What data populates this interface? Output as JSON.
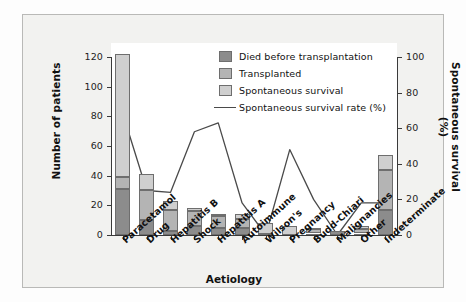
{
  "chart_data": {
    "type": "bar",
    "title": "",
    "subtitle": "",
    "xlabel": "Aetiology",
    "ylabel": "Number of patients",
    "ylabel_secondary": "Spontaneous survival (%)",
    "ylim": [
      0,
      120
    ],
    "ylim_secondary": [
      0,
      100
    ],
    "yticks": [
      0,
      20,
      40,
      60,
      80,
      100,
      120
    ],
    "yticks_secondary": [
      0,
      20,
      40,
      60,
      80,
      100
    ],
    "grid": false,
    "legend_position": "upper-center-right",
    "stacked": true,
    "categories": [
      "Paracetamol",
      "Drug",
      "Hepatitis B",
      "Shock",
      "Hepatitis A",
      "Autoimmune",
      "Wilson's",
      "Pregnancy",
      "Budd-Chiari",
      "Malignancies",
      "Other",
      "Indeterminate"
    ],
    "series": [
      {
        "name": "Died before transplantation",
        "color": "#8c8c8c",
        "values": [
          31,
          10,
          3,
          6,
          5,
          5,
          1,
          0,
          1,
          3,
          1,
          17
        ]
      },
      {
        "name": "Transplanted",
        "color": "#b4b4b4",
        "values": [
          8,
          20,
          14,
          10,
          8,
          6,
          0,
          0,
          3,
          0,
          3,
          27
        ]
      },
      {
        "name": "Spontaneous survival",
        "color": "#cfcfcf",
        "values": [
          83,
          11,
          6,
          2,
          1,
          3,
          7,
          6,
          1,
          0,
          2,
          10
        ]
      }
    ],
    "totals": [
      122,
      41,
      23,
      18,
      14,
      14,
      8,
      6,
      5,
      3,
      6,
      54
    ],
    "line_series": {
      "name": "Spontaneous survival rate (%)",
      "color": "#4a4a4a",
      "axis": "secondary",
      "values": [
        68,
        25,
        24,
        58,
        63,
        18,
        0,
        48,
        20,
        0,
        18,
        18
      ]
    }
  },
  "legend": {
    "items": [
      {
        "label": "Died before transplantation",
        "type": "swatch",
        "swatch_class": "seg-died"
      },
      {
        "label": "Transplanted",
        "type": "swatch",
        "swatch_class": "seg-trans"
      },
      {
        "label": "Spontaneous survival",
        "type": "swatch",
        "swatch_class": "seg-spont"
      },
      {
        "label": "Spontaneous survival rate (%)",
        "type": "line",
        "swatch_class": ""
      }
    ]
  },
  "axes": {
    "left_title": "Number of patients",
    "right_title": "Spontaneous survival (%)",
    "bottom_title": "Aetiology",
    "left_ticks": [
      "120",
      "100",
      "80",
      "60",
      "40",
      "20",
      "0"
    ],
    "right_ticks": [
      "100",
      "80",
      "60",
      "40",
      "20",
      "0"
    ]
  }
}
